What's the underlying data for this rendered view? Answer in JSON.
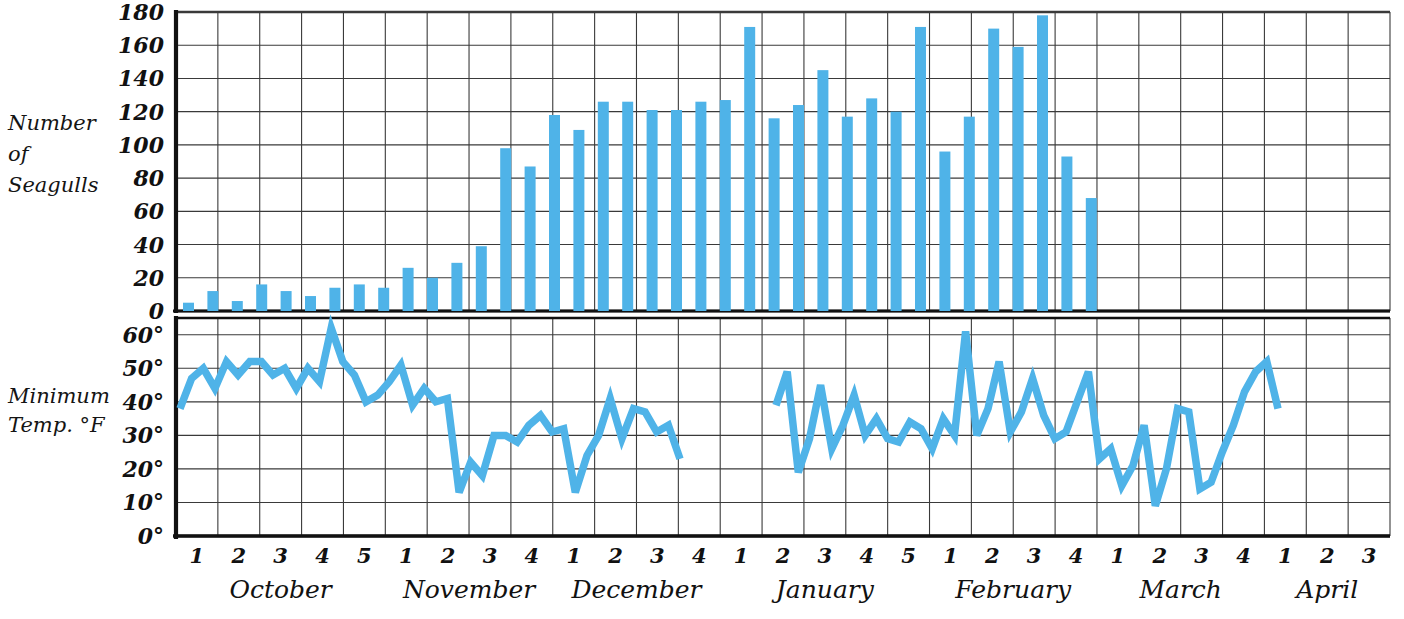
{
  "chart_data": [
    {
      "type": "bar",
      "title": "",
      "ylabel": "Number of Seagulls",
      "xlabel": "",
      "ylim": [
        0,
        180
      ],
      "yticks": [
        0,
        20,
        40,
        60,
        80,
        100,
        120,
        140,
        160,
        180
      ],
      "ytick_labels": [
        "0",
        "20",
        "40",
        "60",
        "80",
        "100",
        "120",
        "140",
        "160",
        "180"
      ],
      "grid": true,
      "legend": "none",
      "bar_color": "#4FB3E8",
      "categories": [
        "Oct 1",
        "Oct 1b",
        "Oct 2",
        "Oct 2b",
        "Oct 3",
        "Oct 3b",
        "Oct 4",
        "Oct 4b",
        "Oct 5",
        "Oct 5b",
        "Nov 1",
        "Nov 1b",
        "Nov 2",
        "Nov 2b",
        "Nov 3",
        "Nov 3b",
        "Nov 4",
        "Nov 4b",
        "Dec 1",
        "Dec 1b",
        "Dec 2",
        "Dec 2b",
        "Dec 3",
        "Dec 3b",
        "Dec 4",
        "Jan 2",
        "Jan 2b",
        "Jan 3",
        "Jan 3b",
        "Jan 4",
        "Jan 4b",
        "Jan 5",
        "Feb 1",
        "Feb 1b",
        "Feb 2",
        "Feb 2b",
        "Feb 3",
        "Feb 3b",
        "Feb 4",
        "Feb 4b",
        "Mar 1",
        "Mar 1b",
        "Mar 2",
        "Mar 2b",
        "Mar 3",
        "Mar 3b",
        "Mar 4",
        "Mar 4b",
        "Apr 1"
      ],
      "values": [
        5,
        12,
        6,
        16,
        12,
        9,
        14,
        16,
        14,
        26,
        20,
        29,
        39,
        98,
        87,
        118,
        109,
        126,
        126,
        121,
        121,
        126,
        127,
        171,
        116,
        124,
        145,
        117,
        128,
        120,
        171,
        96,
        117,
        170,
        159,
        178,
        93,
        68,
        0,
        0,
        0,
        0,
        0,
        0,
        0,
        0,
        0,
        0,
        0
      ]
    },
    {
      "type": "line",
      "title": "",
      "ylabel": "Minimum Temp. °F",
      "xlabel": "",
      "ylim": [
        0,
        65
      ],
      "yticks": [
        0,
        10,
        20,
        30,
        40,
        50,
        60
      ],
      "ytick_labels": [
        "0°",
        "10°",
        "20°",
        "30°",
        "40°",
        "50°",
        "60°"
      ],
      "grid": true,
      "legend": "none",
      "line_color": "#4FB3E8",
      "values": [
        38,
        47,
        50,
        44,
        52,
        48,
        52,
        52,
        48,
        50,
        44,
        50,
        46,
        62,
        52,
        48,
        40,
        42,
        46,
        51,
        39,
        44,
        40,
        41,
        13,
        22,
        18,
        30,
        30,
        28,
        33,
        36,
        31,
        32,
        13,
        24,
        30,
        41,
        29,
        38,
        37,
        31,
        33,
        23,
        39,
        49,
        19,
        29,
        45,
        26,
        33,
        42,
        30,
        35,
        29,
        28,
        34,
        32,
        26,
        35,
        30,
        61,
        30,
        38,
        52,
        31,
        37,
        47,
        36,
        29,
        31,
        40,
        49,
        23,
        26,
        15,
        21,
        33,
        9,
        20,
        38,
        37,
        14,
        16,
        25,
        33,
        43,
        49,
        52,
        38
      ]
    }
  ],
  "y_axis_top": {
    "label_lines": [
      "Number",
      "of",
      "Seagulls"
    ],
    "ticks": [
      "180",
      "160",
      "140",
      "120",
      "100",
      "80",
      "60",
      "40",
      "20",
      "0"
    ]
  },
  "y_axis_bottom": {
    "label_lines": [
      "Minimum",
      "Temp. °F"
    ],
    "ticks": [
      "60°",
      "50°",
      "40°",
      "30°",
      "20°",
      "10°",
      "0°"
    ]
  },
  "x_axis": {
    "months": [
      {
        "name": "October",
        "weeks": [
          "1",
          "2",
          "3",
          "4",
          "5"
        ]
      },
      {
        "name": "November",
        "weeks": [
          "1",
          "2",
          "3",
          "4"
        ]
      },
      {
        "name": "December",
        "weeks": [
          "1",
          "2",
          "3",
          "4"
        ]
      },
      {
        "name": "January",
        "weeks": [
          "1",
          "2",
          "3",
          "4",
          "5"
        ]
      },
      {
        "name": "February",
        "weeks": [
          "1",
          "2",
          "3",
          "4"
        ]
      },
      {
        "name": "March",
        "weeks": [
          "1",
          "2",
          "3",
          "4"
        ]
      },
      {
        "name": "April",
        "weeks": [
          "1",
          "2",
          "3"
        ]
      }
    ]
  },
  "colors": {
    "data_blue": "#4FB3E8",
    "grid": "#3a3a3a",
    "frame": "#111111",
    "paper": "#ffffff"
  }
}
